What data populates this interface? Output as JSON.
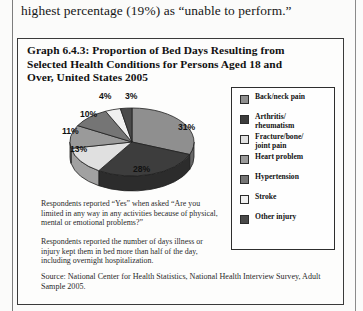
{
  "page": {
    "body_text": "highest percentage (19%) as “unable to perform.”"
  },
  "figure": {
    "title": "Graph 6.4.3: Proportion of Bed Days Resulting from Selected Health Conditions for Persons Aged 18 and Over, United States 2005",
    "note_1": "Respondents reported “Yes” when asked “Are you limited in any way in any activities because of physical, mental or emotional problems?”",
    "note_2": "Respondents reported the number of days illness or injury kept them in bed more than half of the day, including overnight hospitalization.",
    "source": "Source: National Center for Health Statistics, National Health Interview Survey, Adult Sample 2005."
  },
  "chart_data": {
    "type": "pie",
    "title": "Graph 6.4.3: Proportion of Bed Days Resulting from Selected Health Conditions for Persons Aged 18 and Over, United States 2005",
    "xlabel": "",
    "ylabel": "",
    "unit": "percent",
    "legend_position": "right",
    "three_d": true,
    "categories": [
      "Back/neck pain",
      "Arthritis/ rheumatism",
      "Fracture/bone/ joint pain",
      "Heart problem",
      "Hypertension",
      "Stroke",
      "Other injury"
    ],
    "values": [
      31,
      28,
      13,
      11,
      10,
      4,
      3
    ],
    "labels": [
      "31%",
      "28%",
      "13%",
      "11%",
      "10%",
      "4%",
      "3%"
    ],
    "colors": [
      "#8f8f8f",
      "#3d3d3d",
      "#e0e0e0",
      "#9a9a9a",
      "#757575",
      "#f0f0f0",
      "#4a4a4a"
    ]
  },
  "legend": {
    "items": [
      {
        "label": "Back/neck pain",
        "color": "#8f8f8f",
        "value": "31%"
      },
      {
        "label": "Arthritis/\nrheumatism",
        "color": "#3d3d3d",
        "value": "28%"
      },
      {
        "label": "Fracture/bone/\njoint pain",
        "color": "#e0e0e0",
        "value": "13%"
      },
      {
        "label": "Heart problem",
        "color": "#9a9a9a",
        "value": "11%"
      },
      {
        "label": "Hypertension",
        "color": "#757575",
        "value": "10%"
      },
      {
        "label": "Stroke",
        "color": "#f0f0f0",
        "value": "4%"
      },
      {
        "label": "Other injury",
        "color": "#4a4a4a",
        "value": "3%"
      }
    ]
  }
}
